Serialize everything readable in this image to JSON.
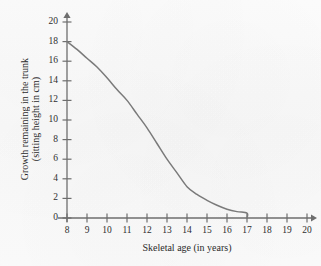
{
  "chart_data": {
    "type": "line",
    "title": "",
    "xlabel": "Skeletal age (in years)",
    "ylabel": "Growth remaining in the trunk (sitting height in cm)",
    "ylabel_line1": "Growth remaining in the trunk",
    "ylabel_line2": "(sitting height in cm)",
    "xlim": [
      8,
      20
    ],
    "ylim": [
      0,
      20
    ],
    "xticks": [
      8,
      9,
      10,
      11,
      12,
      13,
      14,
      15,
      16,
      17,
      18,
      19,
      20
    ],
    "xtick_labels": [
      "8",
      "9",
      "10",
      "11",
      "12",
      "13",
      "14",
      "15",
      "16",
      "17",
      "18",
      "19",
      "20"
    ],
    "yticks": [
      0,
      2,
      4,
      6,
      8,
      10,
      12,
      14,
      16,
      18,
      20
    ],
    "ytick_labels": [
      "0",
      "2",
      "4",
      "6",
      "8",
      "10",
      "12",
      "14",
      "16",
      "18",
      "20"
    ],
    "grid": false,
    "legend": null,
    "axis_arrows": true,
    "line_color": "#7a7a7a",
    "axis_color": "#6e6e6e",
    "series": [
      {
        "name": "Growth remaining in the trunk",
        "x": [
          8,
          8.5,
          9,
          9.5,
          10,
          10.5,
          11,
          11.5,
          12,
          12.5,
          13,
          13.5,
          14,
          14.5,
          15,
          15.5,
          16,
          16.5,
          17,
          17
        ],
        "values": [
          18,
          17.2,
          16.3,
          15.4,
          14.3,
          13.1,
          12.0,
          10.6,
          9.2,
          7.6,
          6.0,
          4.6,
          3.2,
          2.4,
          1.8,
          1.3,
          0.9,
          0.65,
          0.5,
          0
        ]
      }
    ],
    "annotations": []
  }
}
